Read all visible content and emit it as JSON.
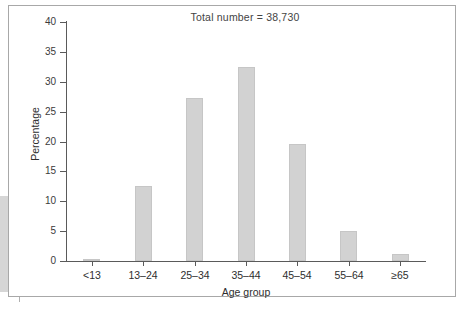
{
  "figure": {
    "title": "Total number = 38,730"
  },
  "chart_data": {
    "type": "bar",
    "title": "Total number = 38,730",
    "xlabel": "Age group",
    "ylabel": "Percentage",
    "categories": [
      "<13",
      "13–24",
      "25–34",
      "35–44",
      "45–54",
      "55–64",
      "≥65"
    ],
    "values": [
      0.4,
      12.5,
      27.3,
      32.4,
      19.6,
      5.0,
      1.2
    ],
    "ylim": [
      0,
      40
    ],
    "yticks": [
      0,
      5,
      10,
      15,
      20,
      25,
      30,
      35,
      40
    ],
    "ytick_labels": [
      "0",
      "5",
      "10",
      "15",
      "20",
      "25",
      "30",
      "35",
      "40"
    ],
    "grid": false,
    "legend": null,
    "bar_color": "#d2d2d2",
    "axis_color": "#5a5a5a"
  }
}
